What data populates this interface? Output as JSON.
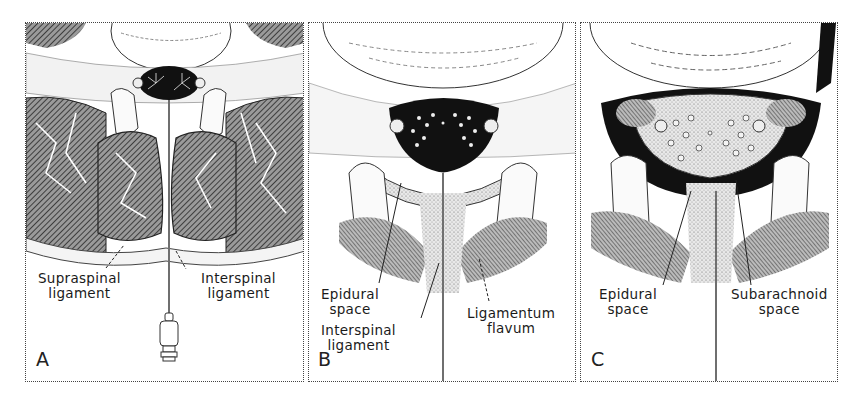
{
  "figure": {
    "panels": [
      {
        "id": "A",
        "letter": "A",
        "labels": {
          "supraspinal_1": "Supraspinal",
          "supraspinal_2": "ligament",
          "interspinal_1": "Interspinal",
          "interspinal_2": "ligament"
        }
      },
      {
        "id": "B",
        "letter": "B",
        "labels": {
          "epidural_1": "Epidural",
          "epidural_2": "space",
          "interspinal_1": "Interspinal",
          "interspinal_2": "ligament",
          "flavum_1": "Ligamentum",
          "flavum_2": "flavum"
        }
      },
      {
        "id": "C",
        "letter": "C",
        "labels": {
          "epidural_1": "Epidural",
          "epidural_2": "space",
          "subarachnoid_1": "Subarachnoid",
          "subarachnoid_2": "space"
        }
      }
    ],
    "colors": {
      "ink": "#1a1a1a",
      "muscle": "#6a6a6a",
      "cord": "#111111",
      "paper": "#ffffff"
    }
  }
}
